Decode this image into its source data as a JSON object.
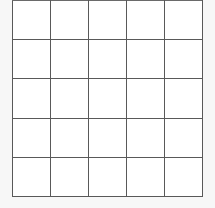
{
  "figure": {
    "kind": "grid",
    "title": "",
    "rows": 5,
    "columns": 5,
    "cell_contents": [
      [
        "",
        "",
        "",
        "",
        ""
      ],
      [
        "",
        "",
        "",
        "",
        ""
      ],
      [
        "",
        "",
        "",
        "",
        ""
      ],
      [
        "",
        "",
        "",
        "",
        ""
      ],
      [
        "",
        "",
        "",
        "",
        ""
      ]
    ],
    "colors": {
      "background": "#f7f7f7",
      "cell_fill": "#ffffff",
      "grid_line": "#595959"
    },
    "geometry": {
      "left": 13,
      "top": 1,
      "right": 202,
      "bottom": 196,
      "cell_width": 37.8,
      "cell_height": 39.0,
      "line_width": 2
    }
  }
}
